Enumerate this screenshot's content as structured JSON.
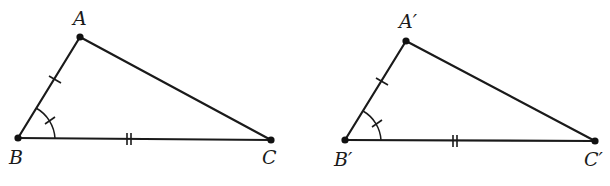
{
  "diagram": {
    "colors": {
      "stroke": "#1a1a1a",
      "background": "#ffffff"
    },
    "triangles": [
      {
        "name": "triangle-ABC",
        "vertices": {
          "A": {
            "label": "A",
            "x": 80,
            "y": 37
          },
          "B": {
            "label": "B",
            "x": 18,
            "y": 138
          },
          "C": {
            "label": "C",
            "x": 271,
            "y": 140
          }
        },
        "marks": {
          "AB": "single-tick",
          "BC": "double-tick",
          "angle_B": "arc-with-tick"
        }
      },
      {
        "name": "triangle-A'B'C'",
        "vertices": {
          "A": {
            "label": "A′",
            "x": 406,
            "y": 41
          },
          "B": {
            "label": "B′",
            "x": 345,
            "y": 140
          },
          "C": {
            "label": "C′",
            "x": 595,
            "y": 141
          }
        },
        "marks": {
          "AB": "single-tick",
          "BC": "double-tick",
          "angle_B": "arc-with-tick"
        }
      }
    ]
  }
}
